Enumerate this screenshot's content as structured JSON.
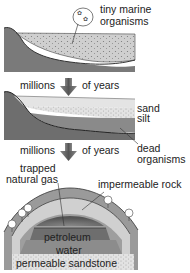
{
  "stage1": {
    "label_line1": "tiny marine",
    "label_line2": "organisms"
  },
  "transition1": {
    "left": "millions",
    "right": "of years"
  },
  "stage2": {
    "sand": "sand",
    "silt": "silt",
    "dead_line1": "dead",
    "dead_line2": "organisms"
  },
  "transition2": {
    "left": "millions",
    "right": "of years"
  },
  "stage3": {
    "gas_line1": "trapped",
    "gas_line2": "natural gas",
    "rock": "impermeable rock",
    "petroleum": "petroleum",
    "water": "water",
    "sandstone": "permeable sandstone"
  },
  "colors": {
    "land": "#7a7a7a",
    "sediment": "#cfcfcf",
    "sand": "#e0e0e0",
    "silt": "#bdbdbd",
    "dead": "#8a8a8a",
    "rock_outer": "#9a9a9a",
    "rock_inner": "#d0d0d0",
    "petroleum": "#6e6e6e",
    "water": "#8c8c8c",
    "sandstone": "#d8d8d8",
    "arrow": "#6a6a6a"
  }
}
